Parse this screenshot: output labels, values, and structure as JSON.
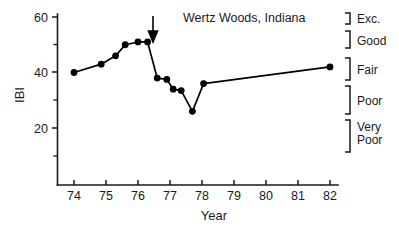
{
  "chart_data": {
    "type": "line",
    "title": "Wertz Woods, Indiana",
    "xlabel": "Year",
    "ylabel": "IBI",
    "xlim": [
      73.3,
      82.6
    ],
    "ylim": [
      8,
      62
    ],
    "grid": false,
    "legend_position": "none",
    "x_ticks": [
      "74",
      "75",
      "76",
      "77",
      "78",
      "79",
      "80",
      "81",
      "82"
    ],
    "x_tick_values": [
      74,
      75,
      76,
      77,
      78,
      79,
      80,
      81,
      82
    ],
    "y_ticks": [
      "20",
      "40",
      "60"
    ],
    "y_tick_values": [
      20,
      40,
      60
    ],
    "y_minor_tick_values": [
      10,
      30,
      50
    ],
    "series": [
      {
        "name": "IBI",
        "x": [
          74.0,
          74.85,
          75.3,
          75.6,
          76.0,
          76.3,
          76.6,
          76.9,
          77.1,
          77.35,
          77.7,
          78.05,
          82.0
        ],
        "values": [
          40,
          43,
          46,
          50,
          51,
          51,
          38,
          37.5,
          34,
          33.5,
          26,
          36,
          42
        ]
      }
    ],
    "annotations": [
      {
        "type": "arrow",
        "direction": "down",
        "x": 76.55,
        "y_from": 59,
        "y_to": 53,
        "label": ""
      }
    ],
    "category_brackets": [
      {
        "label": "Exc.",
        "y_top": 62,
        "y_bottom": 55
      },
      {
        "label": "Good",
        "y_top": 53,
        "y_bottom": 45
      },
      {
        "label": "Fair",
        "y_top": 43,
        "y_bottom": 35
      },
      {
        "label": "Poor",
        "y_top": 33,
        "y_bottom": 22
      },
      {
        "label": "Very\nPoor",
        "y_top": 20,
        "y_bottom": 8
      }
    ]
  },
  "labels": {
    "title": "Wertz Woods, Indiana",
    "x_axis_title": "Year",
    "y_axis_title": "IBI",
    "y_60": "60",
    "y_40": "40",
    "y_20": "20",
    "x_74": "74",
    "x_75": "75",
    "x_76": "76",
    "x_77": "77",
    "x_78": "78",
    "x_79": "79",
    "x_80": "80",
    "x_81": "81",
    "x_82": "82",
    "bracket_exc": "Exc.",
    "bracket_good": "Good",
    "bracket_fair": "Fair",
    "bracket_poor": "Poor",
    "bracket_very": "Very",
    "bracket_poor2": "Poor"
  }
}
